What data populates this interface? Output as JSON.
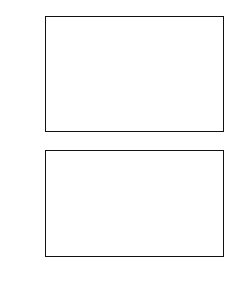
{
  "figure": {
    "background": "#ffffff",
    "foreground": "#111111",
    "panels": [
      "top-panel",
      "bottom-panel"
    ]
  },
  "legend": {
    "position": "top-right of bottom panel",
    "entries": [
      {
        "label": "Uncorrelated",
        "style": "solid",
        "sample": "solid-line-sample"
      },
      {
        "label": "Correlated",
        "style": "dotted",
        "sample": "dotted-line-sample"
      },
      {
        "label": "Si/SiO",
        "label_sub": "2",
        "style": "dashed",
        "sample": "dashed-line-sample"
      },
      {
        "label": "SiO",
        "label_sub": "2",
        "label_tail": "/air",
        "style": "dashdot",
        "sample": "dashdot-line-sample"
      }
    ]
  },
  "chart_data": [
    {
      "id": "top-panel",
      "type": "line",
      "title": "",
      "xlabel": "",
      "ylabel": "P",
      "ylabel_sup": "(φ)",
      "ylabel_sub": "⊥",
      "xlim": [
        0,
        180
      ],
      "ylim": [
        0.2,
        1.1
      ],
      "xticks": [
        0,
        30,
        60,
        90,
        120,
        150,
        180
      ],
      "xticklabels": [
        "",
        "",
        "",
        "",
        "",
        "",
        ""
      ],
      "yticks": [
        0.2,
        0.3,
        0.4,
        0.5,
        0.6,
        0.7,
        0.8,
        0.9,
        1.0,
        1.1
      ],
      "yticklabels": [
        "0.2",
        "0.3",
        "0.4",
        "0.5",
        "0.6",
        "0.7",
        "0.8",
        "0.9",
        "1.0",
        "1.1"
      ],
      "grid": false,
      "minor_ticks": true,
      "series": [
        {
          "name": "Uncorrelated",
          "style": "solid",
          "x": [
            0,
            10,
            20,
            30,
            40,
            50,
            60,
            70,
            80,
            90,
            100,
            110,
            120,
            130,
            140,
            150,
            160,
            170,
            180
          ],
          "y": [
            1.0,
            0.995,
            0.982,
            0.96,
            0.93,
            0.895,
            0.862,
            0.834,
            0.814,
            0.804,
            0.803,
            0.81,
            0.826,
            0.85,
            0.882,
            0.918,
            0.953,
            0.982,
            1.0
          ]
        },
        {
          "name": "Correlated",
          "style": "dotted",
          "x": [
            0,
            10,
            20,
            30,
            40,
            50,
            60,
            70,
            80,
            90,
            100,
            110,
            120,
            130,
            140,
            150,
            160,
            170,
            180
          ],
          "y": [
            1.0,
            0.999,
            0.998,
            0.998,
            0.998,
            0.998,
            0.998,
            0.998,
            0.998,
            0.998,
            0.998,
            0.998,
            0.998,
            0.998,
            0.998,
            0.998,
            0.999,
            1.0,
            1.0
          ]
        },
        {
          "name": "Si/SiO2",
          "style": "dashed",
          "x": [
            0,
            10,
            20,
            30,
            40,
            50,
            60,
            70,
            80,
            90,
            100,
            110,
            120,
            130,
            140,
            150,
            160,
            170,
            180
          ],
          "y": [
            1.0,
            1.0,
            1.0,
            1.0,
            1.0,
            1.0,
            1.0,
            1.0,
            1.0,
            1.0,
            1.0,
            1.0,
            1.0,
            1.0,
            1.0,
            1.0,
            1.0,
            1.0,
            1.0
          ]
        },
        {
          "name": "SiO2/air",
          "style": "dashdot",
          "x": [
            0,
            10,
            20,
            30,
            40,
            50,
            60,
            70,
            80,
            90,
            100,
            110,
            120,
            130,
            140,
            150,
            160,
            170,
            180
          ],
          "y": [
            1.0,
            0.975,
            0.915,
            0.83,
            0.73,
            0.622,
            0.515,
            0.41,
            0.31,
            0.24,
            0.225,
            0.268,
            0.35,
            0.455,
            0.57,
            0.69,
            0.805,
            0.92,
            1.0
          ]
        }
      ]
    },
    {
      "id": "bottom-panel",
      "type": "line",
      "title": "",
      "xlabel": "φ",
      "xlabel_sub": "s",
      "xlabel_unit": "(deg)",
      "ylabel": "η",
      "ylabel_sup": "(φ)",
      "ylabel_unit": "(deg)",
      "xlim": [
        0,
        180
      ],
      "ylim": [
        -90,
        90
      ],
      "xticks": [
        0,
        30,
        60,
        90,
        120,
        150,
        180
      ],
      "xticklabels": [
        "0",
        "30",
        "60",
        "90",
        "120",
        "150",
        "180"
      ],
      "yticks": [
        -90,
        -60,
        -30,
        0,
        30,
        60,
        90
      ],
      "yticklabels": [
        "-90",
        "-60",
        "-30",
        "0",
        "30",
        "60",
        "90"
      ],
      "grid": false,
      "minor_ticks": true,
      "series": [
        {
          "name": "Uncorrelated",
          "style": "solid",
          "x": [
            0,
            10,
            20,
            30,
            40,
            50,
            60,
            70,
            80,
            90,
            100,
            110,
            120,
            130,
            140,
            150,
            160,
            170,
            174
          ],
          "y": [
            90,
            79,
            68,
            58,
            48,
            38,
            29,
            20,
            11,
            2,
            -8,
            -18,
            -29,
            -40,
            -51,
            -62,
            -72,
            -82,
            -85
          ]
        },
        {
          "name": "Correlated",
          "style": "dotted",
          "x": [
            0,
            10,
            20,
            30,
            40,
            50,
            60,
            70,
            80,
            90,
            100,
            110,
            120,
            130,
            140,
            150,
            160,
            170,
            174
          ],
          "y": [
            90,
            76,
            63,
            51,
            40,
            30,
            20,
            10,
            0,
            -10,
            -20,
            -30,
            -40,
            -50,
            -59,
            -68,
            -76,
            -83,
            -86
          ]
        },
        {
          "name": "Si/SiO2",
          "style": "dashed",
          "x": [
            0,
            10,
            20,
            30,
            40,
            50,
            60,
            70,
            80,
            90,
            100,
            110,
            120,
            130,
            140,
            150,
            160,
            170,
            174
          ],
          "y": [
            90,
            79,
            68,
            58,
            48,
            38,
            29,
            20,
            11,
            2,
            -8,
            -18,
            -29,
            -40,
            -51,
            -62,
            -72,
            -82,
            -85
          ]
        },
        {
          "name": "SiO2/air-upper",
          "style": "dashdot",
          "x": [
            0,
            10,
            20,
            30,
            40,
            50,
            60,
            70,
            80
          ],
          "y": [
            90,
            84,
            80,
            77,
            74,
            72,
            71,
            71,
            73
          ]
        },
        {
          "name": "SiO2/air-lower",
          "style": "dashdot",
          "x": [
            90,
            100,
            110,
            120,
            130,
            140,
            150,
            160,
            170,
            174
          ],
          "y": [
            -85,
            -73,
            -69,
            -68,
            -69,
            -71,
            -74,
            -78,
            -84,
            -86
          ]
        }
      ]
    }
  ]
}
